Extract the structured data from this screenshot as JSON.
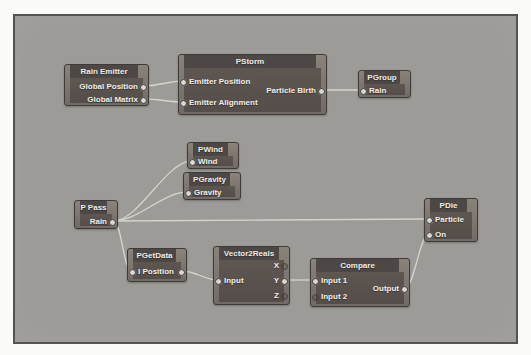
{
  "app": {
    "title": "particle node graph editor",
    "description": "node-based particle flow graph"
  },
  "canvas": {
    "rect": {
      "x": 13,
      "y": 14,
      "w": 505,
      "h": 330
    },
    "background": "#9c9b98",
    "border_color": "#55534f"
  },
  "colors": {
    "wire": "#d6d4cf",
    "node_frame": "#7c7570",
    "node_header": "#4d4846",
    "node_body": "#5b534f",
    "node_text": "#f0ede8",
    "port_connected": "#dcd7d0",
    "port_empty_ring": "#45413d"
  },
  "nodes": [
    {
      "id": "rain-emitter",
      "title": "Rain Emitter",
      "x": 64,
      "y": 64,
      "w": 85,
      "h": 42,
      "ports": [
        {
          "id": "global-position",
          "label": "Global Position",
          "side": "right",
          "y": 86,
          "connected": true
        },
        {
          "id": "global-matrix",
          "label": "Global Matrix",
          "side": "right",
          "y": 99,
          "connected": true
        }
      ]
    },
    {
      "id": "pstorm",
      "title": "PStorm",
      "x": 178,
      "y": 54,
      "w": 149,
      "h": 61,
      "ports": [
        {
          "id": "emitter-position",
          "label": "Emitter Position",
          "side": "left",
          "y": 81,
          "connected": true
        },
        {
          "id": "emitter-alignment",
          "label": "Emitter Alignment",
          "side": "left",
          "y": 102,
          "connected": true
        },
        {
          "id": "particle-birth",
          "label": "Particle Birth",
          "side": "right",
          "y": 90,
          "connected": true
        }
      ]
    },
    {
      "id": "pgroup",
      "title": "PGroup",
      "x": 358,
      "y": 70,
      "w": 53,
      "h": 28,
      "ports": [
        {
          "id": "rain",
          "label": "Rain",
          "side": "left",
          "y": 90,
          "connected": true
        }
      ]
    },
    {
      "id": "pwind",
      "title": "PWind",
      "x": 187,
      "y": 142,
      "w": 52,
      "h": 27,
      "ports": [
        {
          "id": "wind",
          "label": "Wind",
          "side": "left",
          "y": 161,
          "connected": true
        }
      ]
    },
    {
      "id": "pgravity",
      "title": "PGravity",
      "x": 183,
      "y": 172,
      "w": 58,
      "h": 28,
      "ports": [
        {
          "id": "gravity",
          "label": "Gravity",
          "side": "left",
          "y": 192,
          "connected": true
        }
      ]
    },
    {
      "id": "p-pass",
      "title": "P Pass",
      "x": 74,
      "y": 200,
      "w": 44,
      "h": 29,
      "ports": [
        {
          "id": "rain",
          "label": "Rain",
          "side": "right",
          "y": 221,
          "connected": true
        }
      ]
    },
    {
      "id": "pdie",
      "title": "PDie",
      "x": 424,
      "y": 198,
      "w": 54,
      "h": 44,
      "ports": [
        {
          "id": "particle",
          "label": "Particle",
          "side": "left",
          "y": 219,
          "connected": true
        },
        {
          "id": "on",
          "label": "On",
          "side": "left",
          "y": 234,
          "connected": true
        }
      ]
    },
    {
      "id": "pgetdata",
      "title": "PGetData",
      "x": 127,
      "y": 248,
      "w": 60,
      "h": 34,
      "ports": [
        {
          "id": "i-position",
          "label": "I Position",
          "side": "left",
          "y": 271,
          "connected": true
        },
        {
          "id": "i-position-out",
          "label": "",
          "side": "right",
          "y": 271,
          "connected": true
        }
      ]
    },
    {
      "id": "vector2reals",
      "title": "Vector2Reals",
      "x": 213,
      "y": 246,
      "w": 77,
      "h": 59,
      "ports": [
        {
          "id": "input",
          "label": "Input",
          "side": "left",
          "y": 280,
          "connected": true
        },
        {
          "id": "x",
          "label": "X",
          "side": "right",
          "y": 265,
          "connected": false
        },
        {
          "id": "y",
          "label": "Y",
          "side": "right",
          "y": 280,
          "connected": true
        },
        {
          "id": "z",
          "label": "Z",
          "side": "right",
          "y": 295,
          "connected": false
        }
      ]
    },
    {
      "id": "compare",
      "title": "Compare",
      "x": 310,
      "y": 258,
      "w": 100,
      "h": 49,
      "ports": [
        {
          "id": "input-1",
          "label": "Input 1",
          "side": "left",
          "y": 280,
          "connected": true
        },
        {
          "id": "input-2",
          "label": "Input 2",
          "side": "left",
          "y": 296,
          "connected": false
        },
        {
          "id": "output",
          "label": "Output",
          "side": "right",
          "y": 288,
          "connected": true
        }
      ]
    }
  ],
  "wires": [
    {
      "from": "rain-emitter.global-position",
      "to": "pstorm.emitter-position"
    },
    {
      "from": "rain-emitter.global-matrix",
      "to": "pstorm.emitter-alignment"
    },
    {
      "from": "pstorm.particle-birth",
      "to": "pgroup.rain"
    },
    {
      "from": "p-pass.rain",
      "to": "pwind.wind"
    },
    {
      "from": "p-pass.rain",
      "to": "pgravity.gravity"
    },
    {
      "from": "p-pass.rain",
      "to": "pdie.particle"
    },
    {
      "from": "p-pass.rain",
      "to": "pgetdata.i-position"
    },
    {
      "from": "pgetdata.i-position-out",
      "to": "vector2reals.input"
    },
    {
      "from": "vector2reals.y",
      "to": "compare.input-1"
    },
    {
      "from": "compare.output",
      "to": "pdie.on"
    }
  ]
}
